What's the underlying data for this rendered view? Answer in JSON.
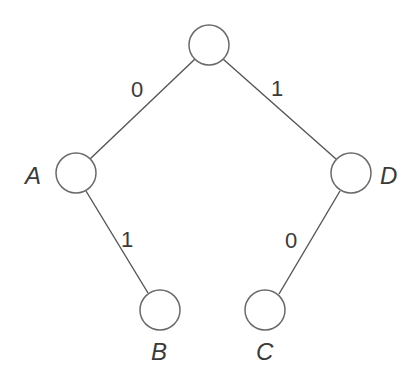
{
  "diagram": {
    "type": "binary-tree",
    "nodes": [
      {
        "id": "root",
        "label": "",
        "cx": 209,
        "cy": 45,
        "r": 20
      },
      {
        "id": "A",
        "label": "A",
        "cx": 76,
        "cy": 173,
        "r": 20
      },
      {
        "id": "D",
        "label": "D",
        "cx": 351,
        "cy": 173,
        "r": 20
      },
      {
        "id": "B",
        "label": "B",
        "cx": 160,
        "cy": 310,
        "r": 20
      },
      {
        "id": "C",
        "label": "C",
        "cx": 265,
        "cy": 310,
        "r": 20
      }
    ],
    "edges": [
      {
        "from": "root",
        "to": "A",
        "label": "0"
      },
      {
        "from": "root",
        "to": "D",
        "label": "1"
      },
      {
        "from": "A",
        "to": "B",
        "label": "1"
      },
      {
        "from": "D",
        "to": "C",
        "label": "0"
      }
    ],
    "labels": {
      "edge_root_A": "0",
      "edge_root_D": "1",
      "edge_A_B": "1",
      "edge_D_C": "0",
      "node_A": "A",
      "node_D": "D",
      "node_B": "B",
      "node_C": "C"
    }
  }
}
